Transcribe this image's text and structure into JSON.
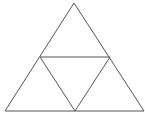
{
  "diagram": {
    "type": "sierpinski-triangle-level-1",
    "stroke_color": "#555555",
    "background": "#ffffff",
    "outer_triangle": {
      "apex": [
        74,
        3
      ],
      "bottom_left": [
        5,
        111
      ],
      "bottom_right": [
        144,
        111
      ]
    },
    "inner_triangle": {
      "left_mid": [
        40,
        57
      ],
      "right_mid": [
        110,
        57
      ],
      "bottom_mid": [
        75,
        111
      ]
    }
  }
}
